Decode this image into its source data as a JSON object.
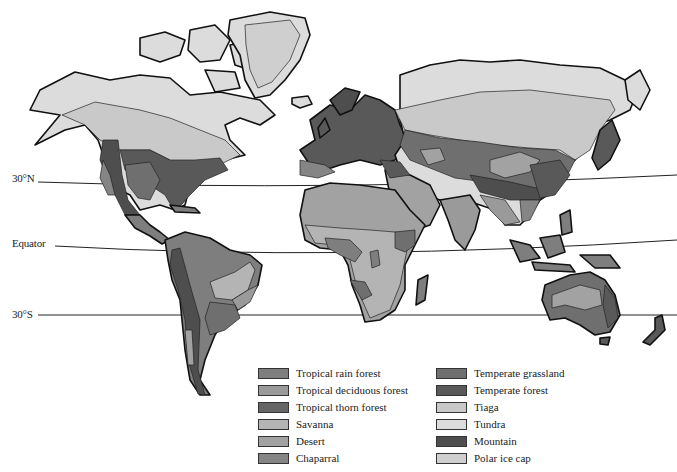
{
  "latitude_lines": [
    {
      "label": "30°N",
      "y_left": 180,
      "y_right": 175
    },
    {
      "label": "Equator",
      "y_left": 245,
      "y_right": 240
    },
    {
      "label": "30°S",
      "y_left": 315,
      "y_right": 315
    }
  ],
  "legend": {
    "items": [
      {
        "label": "Tropical rain forest",
        "color": "#7e7e7e"
      },
      {
        "label": "Tropical deciduous forest",
        "color": "#9a9a9a"
      },
      {
        "label": "Tropical thorn forest",
        "color": "#656565"
      },
      {
        "label": "Savanna",
        "color": "#b4b4b4"
      },
      {
        "label": "Desert",
        "color": "#a2a2a2"
      },
      {
        "label": "Chaparral",
        "color": "#858585"
      },
      {
        "label": "Temperate grassland",
        "color": "#6f6f6f"
      },
      {
        "label": "Temperate forest",
        "color": "#595959"
      },
      {
        "label": "Tiaga",
        "color": "#c9c9c9"
      },
      {
        "label": "Tundra",
        "color": "#dcdcdc"
      },
      {
        "label": "Mountain",
        "color": "#4e4e4e"
      },
      {
        "label": "Polar ice cap",
        "color": "#cfcfcf"
      }
    ]
  }
}
